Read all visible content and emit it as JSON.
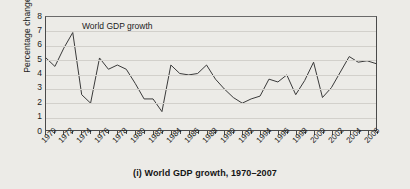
{
  "figure": {
    "caption": "(i) World GDP growth, 1970–2007",
    "series_annotation": "World GDP growth",
    "line_color": "#3a3a3a",
    "grid_color": "#d2d0cb",
    "axis_color": "#4a4a4a",
    "background_color": "#ecebe7"
  },
  "chart_data": {
    "type": "line",
    "title": "(i) World GDP growth, 1970–2007",
    "xlabel": "",
    "ylabel": "Percentage change",
    "ylim": [
      0,
      8
    ],
    "xlim": [
      1970,
      2007
    ],
    "grid": true,
    "legend_position": "inline-annotation",
    "yticks": [
      0,
      1,
      2,
      3,
      4,
      5,
      6,
      7,
      8
    ],
    "ytick_labels": [
      "0",
      "1",
      "2",
      "3",
      "4",
      "5",
      "6",
      "7",
      "8"
    ],
    "xticks": [
      1970,
      1972,
      1974,
      1976,
      1978,
      1980,
      1982,
      1984,
      1986,
      1988,
      1990,
      1992,
      1994,
      1996,
      1998,
      2000,
      2002,
      2004,
      2006
    ],
    "xtick_labels": [
      "1970",
      "1972",
      "1974",
      "1976",
      "1978",
      "1980",
      "1982",
      "1984",
      "1986",
      "1988",
      "1990",
      "1992",
      "1994",
      "1996",
      "1998",
      "2000",
      "2002",
      "2004",
      "2006"
    ],
    "annotations": [
      {
        "text": "World GDP growth",
        "x": 1973.6,
        "y": 6.45
      }
    ],
    "series": [
      {
        "name": "World GDP growth",
        "x": [
          1970,
          1971,
          1972,
          1973,
          1974,
          1975,
          1976,
          1977,
          1978,
          1979,
          1980,
          1981,
          1982,
          1983,
          1984,
          1985,
          1986,
          1987,
          1988,
          1989,
          1990,
          1991,
          1992,
          1993,
          1994,
          1995,
          1996,
          1997,
          1998,
          1999,
          2000,
          2001,
          2002,
          2003,
          2004,
          2005,
          2006,
          2007
        ],
        "values": [
          5.1,
          4.5,
          5.8,
          6.9,
          2.5,
          1.9,
          5.1,
          4.3,
          4.6,
          4.3,
          3.3,
          2.2,
          2.2,
          1.3,
          4.6,
          4.0,
          3.9,
          4.0,
          4.6,
          3.6,
          2.9,
          2.3,
          1.9,
          2.2,
          2.4,
          3.6,
          3.4,
          3.9,
          2.5,
          3.5,
          4.8,
          2.3,
          3.0,
          4.1,
          5.2,
          4.8,
          4.9,
          4.7
        ]
      }
    ]
  }
}
